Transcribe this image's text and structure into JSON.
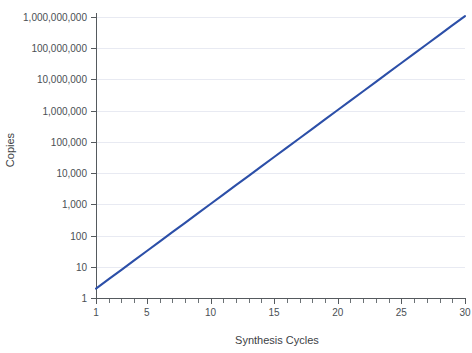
{
  "chart_data": {
    "type": "line",
    "title": "",
    "subtitle": "",
    "xlabel": "Synthesis Cycles",
    "ylabel": "Copies",
    "xscale": "linear",
    "yscale": "log",
    "xlim": [
      1,
      30
    ],
    "ylim": [
      1,
      1000000000
    ],
    "grid": "horizontal",
    "legend": "none",
    "x_tick_labels": [
      "1",
      "5",
      "10",
      "15",
      "20",
      "25",
      "30"
    ],
    "x_tick_values": [
      1,
      5,
      10,
      15,
      20,
      25,
      30
    ],
    "x_minor_tick_values": [
      1,
      2,
      3,
      4,
      5,
      6,
      7,
      8,
      9,
      10,
      11,
      12,
      13,
      14,
      15,
      16,
      17,
      18,
      19,
      20,
      21,
      22,
      23,
      24,
      25,
      26,
      27,
      28,
      29,
      30
    ],
    "y_tick_labels": [
      "1",
      "10",
      "100",
      "1,000",
      "10,000",
      "100,000",
      "1,000,000",
      "10,000,000",
      "100,000,000",
      "1,000,000,000"
    ],
    "y_tick_values": [
      1,
      10,
      100,
      1000,
      10000,
      100000,
      1000000,
      10000000,
      100000000,
      1000000000
    ],
    "series": [
      {
        "name": "Copies",
        "color": "#2c4fa8",
        "x": [
          1,
          2,
          3,
          4,
          5,
          6,
          7,
          8,
          9,
          10,
          11,
          12,
          13,
          14,
          15,
          16,
          17,
          18,
          19,
          20,
          21,
          22,
          23,
          24,
          25,
          26,
          27,
          28,
          29,
          30
        ],
        "values": [
          2,
          4,
          8,
          16,
          32,
          64,
          128,
          256,
          512,
          1024,
          2048,
          4096,
          8192,
          16384,
          32768,
          65536,
          131072,
          262144,
          524288,
          1048576,
          2097152,
          4194304,
          8388608,
          16777216,
          33554432,
          67108864,
          134217728,
          268435456,
          536870912,
          1073741824
        ]
      }
    ]
  },
  "colors": {
    "line": "#2c4fa8",
    "grid": "#e8eaf2",
    "axis": "#555a5e",
    "text": "#4a4f54",
    "background": "#ffffff"
  }
}
